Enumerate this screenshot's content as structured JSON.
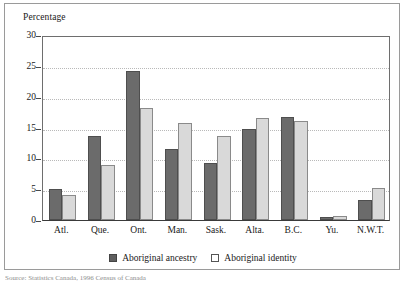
{
  "figure": {
    "axis_title": "Percentage",
    "source_note": "Source: Statistics Canada, 1996 Census of Canada"
  },
  "legend": {
    "position": "bottom-center",
    "items": [
      {
        "label": "Aboriginal ancestry",
        "swatch": "filled-dark-square",
        "color": "#5f5f5f"
      },
      {
        "label": "Aboriginal identity",
        "swatch": "open-light-square",
        "color": "#ffffff"
      }
    ]
  },
  "chart_data": {
    "type": "bar",
    "title": "",
    "subtitle": "",
    "xlabel": "",
    "ylabel": "Percentage",
    "ylim": [
      0,
      30
    ],
    "yticks": [
      0,
      5,
      10,
      15,
      20,
      25,
      30
    ],
    "ytick_labels": [
      "0",
      "5",
      "10",
      "15",
      "20",
      "25",
      "30"
    ],
    "grid": "horizontal-dotted",
    "categories": [
      "Atl.",
      "Que.",
      "Ont.",
      "Man.",
      "Sask.",
      "Alta.",
      "B.C.",
      "Yu.",
      "N.W.T."
    ],
    "series": [
      {
        "name": "Aboriginal ancestry",
        "color": "#6b6b6b",
        "values": [
          5.0,
          13.6,
          24.2,
          11.5,
          9.3,
          14.7,
          16.7,
          0.5,
          3.2
        ]
      },
      {
        "name": "Aboriginal identity",
        "color": "#d9d9d9",
        "values": [
          4.0,
          8.9,
          18.2,
          15.8,
          13.6,
          16.6,
          16.0,
          0.6,
          5.2
        ]
      }
    ]
  }
}
